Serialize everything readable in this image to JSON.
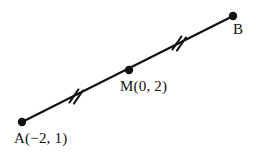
{
  "figure": {
    "kind": "geometry-diagram",
    "background_color": "#ffffff",
    "stroke_color": "#111111",
    "line_width_px": 2.2,
    "dot_radius_px": 4.2,
    "segment": {
      "endpoint_a": {
        "name": "A",
        "x": 22,
        "y": 122
      },
      "endpoint_b": {
        "name": "B",
        "x": 233,
        "y": 16
      },
      "midpoint_m": {
        "name": "M",
        "x": 129,
        "y": 70
      }
    },
    "tick_marks": [
      {
        "name": "tick-am",
        "on_segment": "AM",
        "count": 2,
        "center_x": 76,
        "center_y": 96,
        "length_px": 15,
        "angle_deg": 62
      },
      {
        "name": "tick-mb",
        "on_segment": "MB",
        "count": 2,
        "center_x": 179,
        "center_y": 43,
        "length_px": 15,
        "angle_deg": 62
      }
    ],
    "labels": {
      "a": "A(−2, 1)",
      "m": "M(0, 2)",
      "b": "B"
    }
  }
}
